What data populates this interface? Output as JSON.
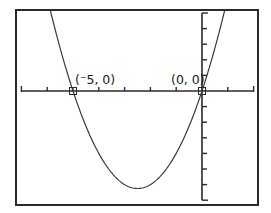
{
  "chart_data": {
    "type": "line",
    "title": "",
    "xlabel": "",
    "ylabel": "",
    "function": "y = x^2 + 5x",
    "coefficients": {
      "a": 1,
      "b": 5,
      "c": 0
    },
    "xlim": [
      -7,
      2
    ],
    "ylim": [
      -7,
      5
    ],
    "xscl": 1,
    "yscl": 1,
    "grid": false,
    "legend": null,
    "series": [
      {
        "name": "parabola",
        "x": [
          -5.854,
          -5.5,
          -5,
          -4.5,
          -4,
          -3.5,
          -3,
          -2.5,
          -2,
          -1.5,
          -1,
          -0.5,
          0,
          0.5,
          0.854
        ],
        "y": [
          5,
          2.75,
          0,
          -2.25,
          -4,
          -5.25,
          -6,
          -6.25,
          -6,
          -5.25,
          -4,
          -2.25,
          0,
          2.75,
          5
        ]
      }
    ],
    "annotations": [
      {
        "label": "(⁻5, 0)",
        "x": -5,
        "y": 0,
        "marker": "square"
      },
      {
        "label": "(0, 0)",
        "x": 0,
        "y": 0,
        "marker": "square"
      }
    ],
    "vertex": {
      "x": -2.5,
      "y": -6.25
    }
  },
  "labels": {
    "point1": "(⁻5, 0)",
    "point2": "(0, 0)"
  },
  "colors": {
    "frame": "#2a2a2a",
    "curve": "#3a3a3a",
    "background": "#ffffff"
  }
}
